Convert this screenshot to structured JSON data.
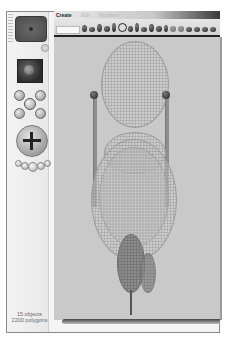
{
  "menu": {
    "items": [
      {
        "label": "Create",
        "active": true
      },
      {
        "label": "Edit",
        "active": false
      },
      {
        "label": "Modifiers",
        "active": false
      }
    ]
  },
  "left_panel": {
    "preview_label": "object-preview",
    "material_label": "material-swatch",
    "controls": [
      "rotate-control",
      "move-control",
      "zoom-control"
    ]
  },
  "status": {
    "objects": "15 objects",
    "polygons": "2200 polygons"
  },
  "colors": {
    "viewport_bg": "#c9c9c9",
    "wireframe": "#9b9b9b",
    "solid_part": "#8c8c8c",
    "shelf_border": "#222222"
  }
}
